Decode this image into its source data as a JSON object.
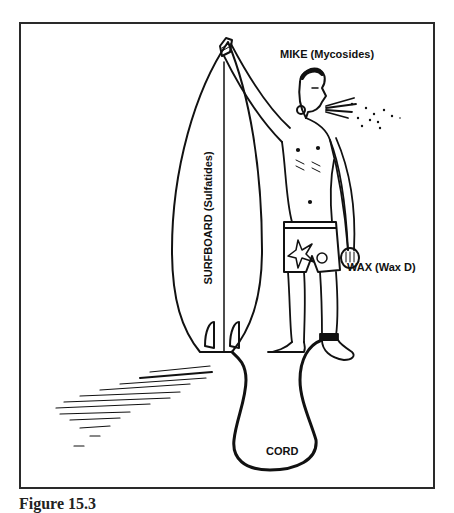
{
  "figure": {
    "caption": "Figure 15.3",
    "labels": {
      "mike": "MIKE (Mycosides)",
      "surfboard": "SURFBOARD (Sulfatides)",
      "wax": "WAX (Wax D)",
      "cord": "CORD"
    }
  },
  "colors": {
    "ink": "#111111",
    "frame": "#2a2a2a",
    "background": "#ffffff"
  }
}
